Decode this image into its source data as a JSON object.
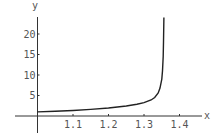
{
  "chart_data": {
    "type": "line",
    "title": "",
    "xlabel": "x",
    "ylabel": "y",
    "x_ticks": [
      "1.1",
      "1.2",
      "1.3",
      "1.4"
    ],
    "y_ticks": [
      "5",
      "10",
      "15",
      "20"
    ],
    "xlim": [
      1.0,
      1.46
    ],
    "ylim": [
      -4,
      24
    ],
    "grid": false,
    "legend": null,
    "series": [
      {
        "name": "y(x)",
        "x": [
          1.0,
          1.05,
          1.1,
          1.15,
          1.2,
          1.25,
          1.28,
          1.3,
          1.32,
          1.33,
          1.34,
          1.345,
          1.35,
          1.352,
          1.354,
          1.355,
          1.356
        ],
        "y": [
          1.0,
          1.15,
          1.35,
          1.6,
          1.95,
          2.45,
          2.85,
          3.25,
          3.9,
          4.5,
          5.6,
          6.8,
          9.0,
          11.0,
          14.5,
          18.0,
          24.0
        ]
      }
    ],
    "asymptote_x": 1.356
  },
  "colors": {
    "axis": "#333333",
    "curve": "#222222",
    "tick_label": "#555555"
  }
}
